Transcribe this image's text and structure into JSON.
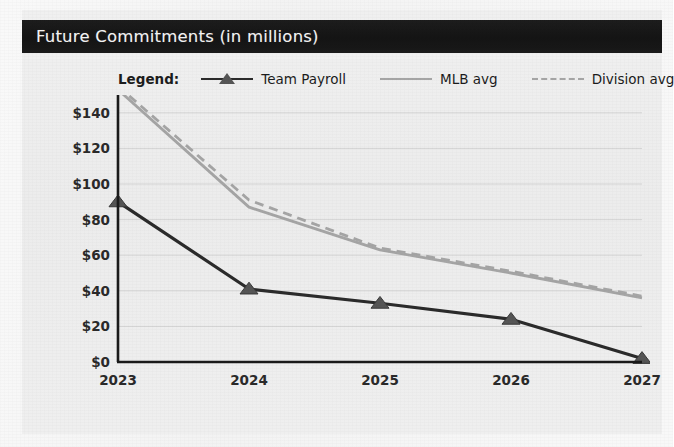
{
  "header": {
    "title": "Future Commitments (in millions)"
  },
  "legend": {
    "title": "Legend:",
    "entries": [
      {
        "label": "Team Payroll",
        "style": "solid-marker",
        "color": "#2b2b2b",
        "marker": "triangle-marker"
      },
      {
        "label": "MLB avg",
        "style": "solid",
        "color": "#a5a5a5",
        "marker": "none"
      },
      {
        "label": "Division avg",
        "style": "dashed",
        "color": "#a5a5a5",
        "marker": "none"
      }
    ]
  },
  "chart_data": {
    "type": "line",
    "title": "Future Commitments (in millions)",
    "xlabel": "",
    "ylabel": "",
    "categories": [
      "2023",
      "2024",
      "2025",
      "2026",
      "2027"
    ],
    "x": [
      2023,
      2024,
      2025,
      2026,
      2027
    ],
    "ylim": [
      0,
      150
    ],
    "xlim": [
      2023,
      2027
    ],
    "yticks": [
      0,
      20,
      40,
      60,
      80,
      100,
      120,
      140
    ],
    "ytick_labels": [
      "$0",
      "$20",
      "$40",
      "$60",
      "$80",
      "$100",
      "$120",
      "$140"
    ],
    "xtick_labels": [
      "2023",
      "2024",
      "2025",
      "2026",
      "2027"
    ],
    "grid": true,
    "grid_axis": "y",
    "legend_position": "top",
    "series": [
      {
        "name": "Team Payroll",
        "values": [
          90,
          41,
          33,
          24,
          2
        ],
        "color": "#2b2b2b",
        "style": "solid",
        "marker": "triangle"
      },
      {
        "name": "MLB avg",
        "values": [
          153,
          87,
          63,
          50,
          36
        ],
        "color": "#a5a5a5",
        "style": "solid",
        "marker": "none"
      },
      {
        "name": "Division avg",
        "values": [
          155,
          91,
          64,
          51,
          37
        ],
        "color": "#a5a5a5",
        "style": "dashed",
        "marker": "none"
      }
    ]
  },
  "axis": {
    "y_labels": [
      "$140",
      "$120",
      "$100",
      "$80",
      "$60",
      "$40",
      "$20",
      "$0"
    ],
    "x_labels": [
      "2023",
      "2024",
      "2025",
      "2026",
      "2027"
    ]
  },
  "colors": {
    "title_bar_bg": "#161616",
    "title_text": "#f4f4f4",
    "page_bg": "#f1f1f1",
    "axis": "#1a1a1a",
    "grid": "#d4d4d4",
    "payroll": "#2b2b2b",
    "average": "#a5a5a5"
  }
}
